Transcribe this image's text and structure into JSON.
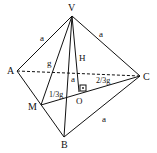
{
  "diagram": {
    "vertices": {
      "V": {
        "label": "V",
        "x": 72,
        "y": 16
      },
      "A": {
        "label": "A",
        "x": 17,
        "y": 71
      },
      "B": {
        "label": "B",
        "x": 64,
        "y": 137
      },
      "C": {
        "label": "C",
        "x": 140,
        "y": 76
      },
      "M": {
        "label": "M",
        "x": 41,
        "y": 105
      },
      "O": {
        "label": "O",
        "x": 79,
        "y": 92
      }
    },
    "edge_labels": {
      "VA": "a",
      "VC": "a",
      "BC": "a",
      "VO_side": "a",
      "VM": "g",
      "height": "H",
      "MO": "1/3g",
      "OC": "2/3g"
    },
    "colors": {
      "line": "#111111",
      "background": "#ffffff"
    }
  }
}
